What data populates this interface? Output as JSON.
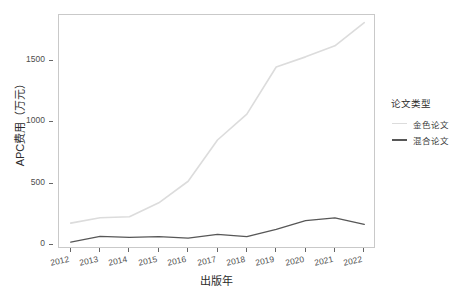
{
  "chart_data": {
    "type": "line",
    "title": "",
    "xlabel": "出版年",
    "ylabel": "APC费用（万元）",
    "x": [
      2012,
      2013,
      2014,
      2015,
      2016,
      2017,
      2018,
      2019,
      2020,
      2021,
      2022
    ],
    "xtick_labels": [
      "2012",
      "2013",
      "2014",
      "2015",
      "2016",
      "2017",
      "2018",
      "2019",
      "2020",
      "2021",
      "2022"
    ],
    "ytick_labels": [
      "0",
      "500",
      "1000",
      "1500"
    ],
    "yticks": [
      0,
      500,
      1000,
      1500
    ],
    "ylim": [
      -30,
      1870
    ],
    "xlim": [
      2011.6,
      2022.4
    ],
    "grid": false,
    "legend_position": "right",
    "series": [
      {
        "name": "金色论文",
        "color": "#dcdcdc",
        "values": [
          180,
          224,
          232,
          345,
          520,
          855,
          1065,
          1448,
          1530,
          1620,
          1808
        ]
      },
      {
        "name": "混合论文",
        "color": "#575757",
        "values": [
          26,
          72,
          64,
          70,
          58,
          88,
          70,
          130,
          200,
          223,
          170
        ]
      }
    ]
  },
  "legend": {
    "title": "论文类型",
    "items": [
      {
        "label": "金色论文",
        "color": "#dcdcdc"
      },
      {
        "label": "混合论文",
        "color": "#575757"
      }
    ]
  },
  "axes": {
    "x_title": "出版年",
    "y_title": "APC费用（万元）"
  }
}
